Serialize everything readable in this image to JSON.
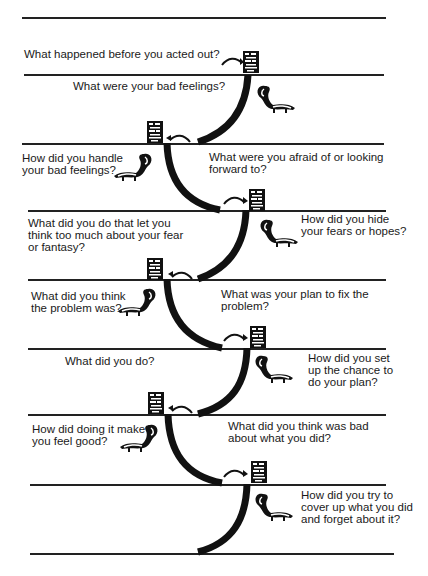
{
  "header_fragment": "(cut-off title text)",
  "questions": [
    {
      "id": "q1",
      "text": "What happened before you acted out?"
    },
    {
      "id": "q2",
      "text": "What were your bad feelings?"
    },
    {
      "id": "q3",
      "text": "How did you handle\nyour bad feelings?"
    },
    {
      "id": "q4",
      "text": "What were you afraid of or looking\nforward to?"
    },
    {
      "id": "q5",
      "text": "What did you do that let you\nthink too much about your fear\nor fantasy?"
    },
    {
      "id": "q6",
      "text": "How did you hide\nyour fears or hopes?"
    },
    {
      "id": "q7",
      "text": "What did you think\nthe problem was?"
    },
    {
      "id": "q8",
      "text": "What was your plan to fix the\nproblem?"
    },
    {
      "id": "q9",
      "text": "What did you do?"
    },
    {
      "id": "q10",
      "text": "How did you set\nup the chance to\ndo your plan?"
    },
    {
      "id": "q11",
      "text": "How did doing it make\nyou feel good?"
    },
    {
      "id": "q12",
      "text": "What did you think was bad\nabout what you did?"
    },
    {
      "id": "q13",
      "text": "How did you try to\ncover up what you did\nand forget about it?"
    }
  ],
  "icons": {
    "notebook": "notebook-icon",
    "skunk": "skunk-icon",
    "arrow": "curved-arrow-icon",
    "path": "curved-path"
  }
}
